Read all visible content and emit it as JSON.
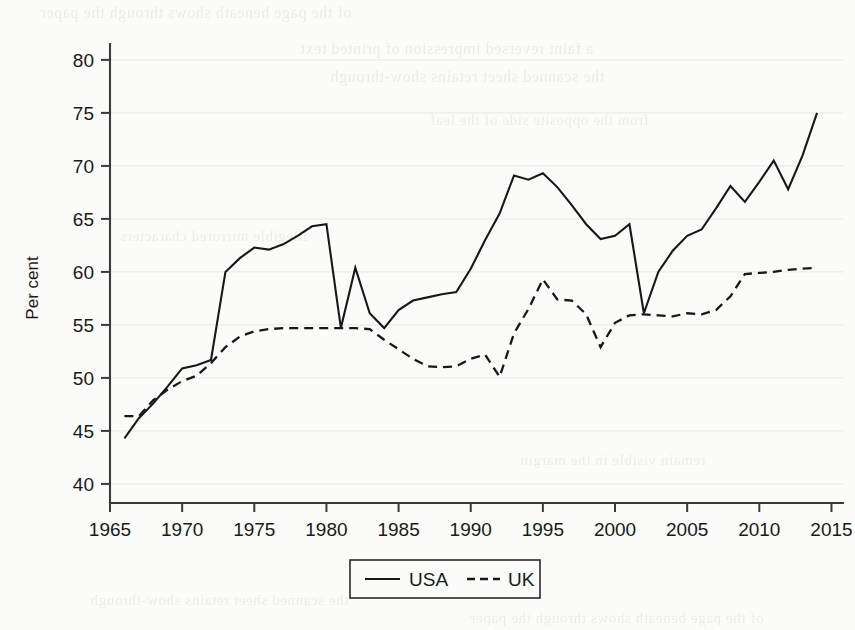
{
  "chart_data": {
    "type": "line",
    "title": "",
    "xlabel": "",
    "ylabel": "Per cent",
    "xlim": [
      1965,
      2015.8
    ],
    "ylim": [
      38.2,
      81.5
    ],
    "xticks": [
      1965,
      1970,
      1975,
      1980,
      1985,
      1990,
      1995,
      2000,
      2005,
      2010,
      2015
    ],
    "yticks": [
      40,
      45,
      50,
      55,
      60,
      65,
      70,
      75,
      80
    ],
    "grid": "horizontal",
    "legend_position": "bottom-center",
    "series": [
      {
        "name": "USA",
        "style": "solid",
        "color": "#181818",
        "x": [
          1966,
          1967,
          1968,
          1969,
          1970,
          1971,
          1972,
          1973,
          1974,
          1975,
          1976,
          1977,
          1978,
          1979,
          1980,
          1981,
          1982,
          1983,
          1984,
          1985,
          1986,
          1987,
          1988,
          1989,
          1990,
          1991,
          1992,
          1993,
          1994,
          1995,
          1996,
          1997,
          1998,
          1999,
          2000,
          2001,
          2002,
          2003,
          2004,
          2005,
          2006,
          2007,
          2008,
          2009,
          2010,
          2011,
          2012,
          2013,
          2014
        ],
        "values": [
          44.3,
          46.2,
          47.6,
          49.2,
          50.9,
          51.2,
          51.7,
          60.0,
          61.3,
          62.3,
          62.1,
          62.6,
          63.4,
          64.3,
          64.5,
          54.7,
          60.4,
          56.1,
          54.7,
          56.4,
          57.3,
          57.6,
          57.9,
          58.1,
          60.3,
          63.0,
          65.5,
          69.1,
          68.7,
          69.3,
          68.0,
          66.3,
          64.5,
          63.1,
          63.4,
          64.5,
          56.1,
          60.0,
          62.0,
          63.4,
          64.0,
          66.0,
          68.1,
          66.6,
          68.5,
          70.5,
          67.8,
          71.0,
          75.0
        ]
      },
      {
        "name": "UK",
        "style": "dashed",
        "color": "#181818",
        "x": [
          1966,
          1967,
          1968,
          1969,
          1970,
          1971,
          1972,
          1973,
          1974,
          1975,
          1976,
          1977,
          1978,
          1979,
          1980,
          1981,
          1982,
          1983,
          1984,
          1985,
          1986,
          1987,
          1988,
          1989,
          1990,
          1991,
          1992,
          1993,
          1994,
          1995,
          1996,
          1997,
          1998,
          1999,
          2000,
          2001,
          2002,
          2003,
          2004,
          2005,
          2006,
          2007,
          2008,
          2009,
          2010,
          2011,
          2012,
          2013,
          2014
        ],
        "values": [
          46.4,
          46.4,
          47.9,
          48.9,
          49.7,
          50.2,
          51.4,
          52.9,
          53.9,
          54.4,
          54.6,
          54.7,
          54.7,
          54.7,
          54.7,
          54.7,
          54.7,
          54.6,
          53.6,
          52.7,
          51.8,
          51.1,
          51.0,
          51.1,
          51.8,
          52.2,
          50.1,
          54.2,
          56.5,
          59.3,
          57.4,
          57.3,
          56.0,
          52.9,
          55.2,
          55.9,
          56.0,
          55.9,
          55.8,
          56.1,
          56.0,
          56.4,
          57.7,
          59.8,
          59.9,
          60.0,
          60.2,
          60.3,
          60.4
        ]
      }
    ],
    "legend_entries": [
      {
        "label": "USA",
        "style": "solid"
      },
      {
        "label": "UK",
        "style": "dashed"
      }
    ]
  },
  "axis": {
    "y_title": "Per cent",
    "y_tick_labels": [
      "80",
      "75",
      "70",
      "65",
      "60",
      "55",
      "50",
      "45",
      "40"
    ],
    "x_tick_labels": [
      "1965",
      "1970",
      "1975",
      "1980",
      "1985",
      "1990",
      "1995",
      "2000",
      "2005",
      "2010",
      "2015"
    ]
  },
  "legend": {
    "usa_label": "USA",
    "uk_label": "UK"
  },
  "ghost_text": {
    "lines": [
      "of the page beneath shows through the paper",
      "a faint reversed impression of printed text",
      "the scanned sheet retains show-through",
      "from the opposite side of the leaf",
      "illegible mirrored characters",
      "remain visible in the margin"
    ]
  }
}
